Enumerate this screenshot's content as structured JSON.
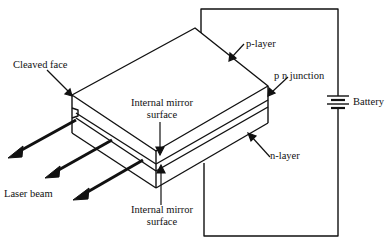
{
  "diagram": {
    "labels": {
      "cleaved_face": "Cleaved face",
      "p_layer": "p-layer",
      "pn_junction": "p n  junction",
      "battery": "Battery",
      "internal_mirror_top_line1": "Internal mirror",
      "internal_mirror_top_line2": "surface",
      "n_layer": "n-layer",
      "laser_beam": "Laser beam",
      "internal_mirror_bottom_line1": "Internal mirror",
      "internal_mirror_bottom_line2": "surface"
    },
    "colors": {
      "line": "#111111",
      "background": "#ffffff"
    }
  }
}
